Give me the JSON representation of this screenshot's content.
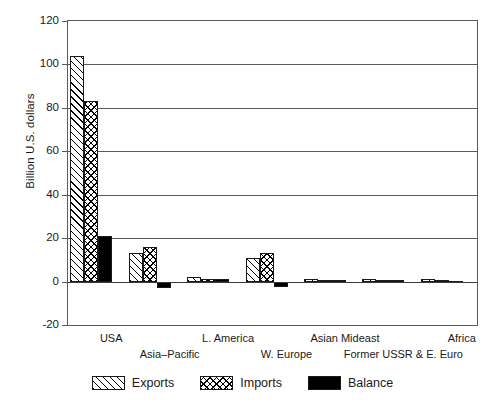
{
  "chart_data": {
    "type": "bar",
    "title": "",
    "subtitle": "",
    "xlabel": "",
    "ylabel": "Billion U.S. dollars",
    "ylim": [
      -20,
      120
    ],
    "ytick_step": 20,
    "yticks": [
      120,
      100,
      80,
      60,
      40,
      20,
      0,
      -20
    ],
    "ytick_labels": [
      "120",
      "100",
      "80",
      "60",
      "40",
      "20",
      "0",
      "-20"
    ],
    "grid": "horizontal",
    "legend_position": "bottom",
    "categories": [
      "USA",
      "Asia–Pacific",
      "L. America",
      "W. Europe",
      "Asian Mideast",
      "Former USSR & E. Euro",
      "Africa"
    ],
    "series": [
      {
        "name": "Exports",
        "pattern": "diagonal-hatch",
        "values": [
          104,
          13,
          2,
          11,
          1,
          1,
          1
        ]
      },
      {
        "name": "Imports",
        "pattern": "cross-hatch",
        "values": [
          83,
          16,
          1,
          13,
          0.6,
          0.6,
          0.8
        ]
      },
      {
        "name": "Balance",
        "pattern": "solid-black",
        "values": [
          21,
          -3,
          1,
          -2.5,
          0.5,
          0.8,
          0.4
        ]
      }
    ]
  },
  "axis": {
    "y_title": "Billion U.S. dollars"
  },
  "legend": {
    "items": [
      {
        "label": "Exports",
        "swatch": "diagonal-hatch-swatch"
      },
      {
        "label": "Imports",
        "swatch": "cross-hatch-swatch"
      },
      {
        "label": "Balance",
        "swatch": "solid-black-swatch"
      }
    ]
  }
}
